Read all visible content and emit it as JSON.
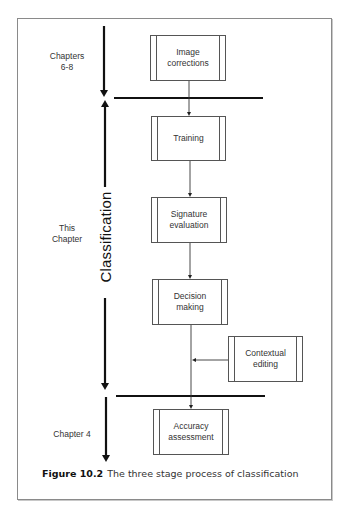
{
  "diagram": {
    "stage_labels": {
      "top": "Chapters\n6-8",
      "middle": "This\nChapter",
      "bottom": "Chapter 4"
    },
    "vertical_title": "Classification",
    "boxes": [
      {
        "id": "image-corrections",
        "label": "Image\ncorrections"
      },
      {
        "id": "training",
        "label": "Training"
      },
      {
        "id": "signature-evaluation",
        "label": "Signature\nevaluation"
      },
      {
        "id": "decision-making",
        "label": "Decision\nmaking"
      },
      {
        "id": "contextual-editing",
        "label": "Contextual\nediting"
      },
      {
        "id": "accuracy-assessment",
        "label": "Accuracy\nassessment"
      }
    ],
    "edges": [
      {
        "from": "image-corrections",
        "to": "training"
      },
      {
        "from": "training",
        "to": "signature-evaluation"
      },
      {
        "from": "signature-evaluation",
        "to": "decision-making"
      },
      {
        "from": "decision-making",
        "to": "accuracy-assessment"
      },
      {
        "from": "contextual-editing",
        "to": "decision-making-to-accuracy-line"
      }
    ],
    "stage_dividers": 2
  },
  "caption": {
    "figure_number": "Figure 10.2",
    "text": "The three stage process of classification"
  }
}
